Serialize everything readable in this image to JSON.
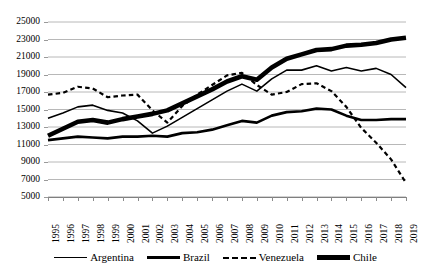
{
  "chart_data": {
    "type": "line",
    "title": "",
    "subtitle": "",
    "xlabel": "",
    "ylabel": "",
    "grid": "horizontal",
    "legend_position": "bottom",
    "ylim": [
      5000,
      25000
    ],
    "ytick_step": 2000,
    "ytick_labels": [
      "25000",
      "23000",
      "21000",
      "19000",
      "17000",
      "15000",
      "13000",
      "11000",
      "9000",
      "7000",
      "5000"
    ],
    "ytick_values": [
      25000,
      23000,
      21000,
      19000,
      17000,
      15000,
      13000,
      11000,
      9000,
      7000,
      5000
    ],
    "categories": [
      "1995",
      "1996",
      "1997",
      "1998",
      "1999",
      "2000",
      "2001",
      "2002",
      "2003",
      "2004",
      "2005",
      "2006",
      "2007",
      "2008",
      "2009",
      "2010",
      "2011",
      "2012",
      "2013",
      "2014",
      "2015",
      "2016",
      "2017",
      "2018",
      "2019"
    ],
    "x": [
      1995,
      1996,
      1997,
      1998,
      1999,
      2000,
      2001,
      2002,
      2003,
      2004,
      2005,
      2006,
      2007,
      2008,
      2009,
      2010,
      2011,
      2012,
      2013,
      2014,
      2015,
      2016,
      2017,
      2018,
      2019
    ],
    "series": [
      {
        "name": "Argentina",
        "style": "solid-thin",
        "color": "#000000",
        "width": 1.6,
        "values": [
          14000,
          14600,
          15300,
          15500,
          14900,
          14600,
          13700,
          12300,
          13100,
          14100,
          15100,
          16100,
          17100,
          17900,
          17100,
          18500,
          19500,
          19500,
          20000,
          19400,
          19800,
          19400,
          19700,
          19000,
          17500
        ]
      },
      {
        "name": "Brazil",
        "style": "solid-medium",
        "color": "#000000",
        "width": 2.6,
        "values": [
          11500,
          11700,
          11900,
          11800,
          11700,
          11900,
          11900,
          12000,
          11900,
          12300,
          12400,
          12700,
          13200,
          13700,
          13500,
          14300,
          14700,
          14800,
          15100,
          15000,
          14300,
          13800,
          13800,
          13900,
          13900
        ]
      },
      {
        "name": "Venezuela",
        "style": "dashed",
        "color": "#000000",
        "width": 2.2,
        "values": [
          16700,
          16900,
          17600,
          17400,
          16400,
          16600,
          16700,
          14900,
          13500,
          15400,
          16700,
          17800,
          18900,
          19200,
          17800,
          16700,
          17000,
          17900,
          18000,
          17100,
          15300,
          12900,
          11200,
          9300,
          6600
        ]
      },
      {
        "name": "Chile",
        "style": "solid-thick",
        "color": "#000000",
        "width": 4.6,
        "values": [
          12000,
          12800,
          13600,
          13800,
          13500,
          13900,
          14200,
          14500,
          14900,
          15700,
          16500,
          17300,
          18200,
          18800,
          18400,
          19800,
          20800,
          21300,
          21800,
          21900,
          22300,
          22400,
          22600,
          23000,
          23200
        ]
      }
    ]
  },
  "legend": {
    "items": [
      {
        "label": "Argentina",
        "swatch": "line-thin-icon"
      },
      {
        "label": "Brazil",
        "swatch": "line-medium-icon"
      },
      {
        "label": "Venezuela",
        "swatch": "line-dashed-icon"
      },
      {
        "label": "Chile",
        "swatch": "line-thick-icon"
      }
    ]
  }
}
